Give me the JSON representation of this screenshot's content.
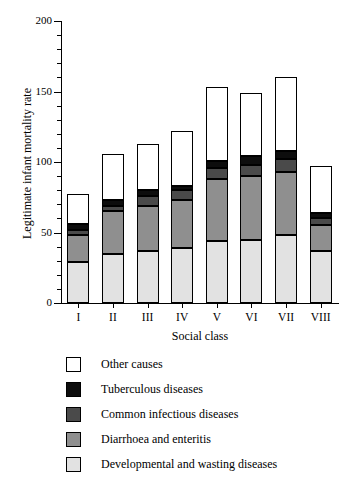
{
  "chart_data": {
    "type": "bar",
    "stacked": true,
    "title": "",
    "xlabel": "Social class",
    "ylabel": "Legitimate infant mortality rate",
    "categories": [
      "I",
      "II",
      "III",
      "IV",
      "V",
      "VI",
      "VII",
      "VIII"
    ],
    "ylim": [
      0,
      200
    ],
    "yticks": [
      0,
      50,
      100,
      150,
      200
    ],
    "ytick_labels": [
      "0",
      "50",
      "100",
      "150",
      "200"
    ],
    "yminor_step": 10,
    "grid": false,
    "legend_position": "below-plot",
    "series": [
      {
        "name": "Developmental and wasting diseases",
        "color": "#e2e2e2",
        "values": [
          29,
          35,
          37,
          39,
          44,
          45,
          48,
          37
        ]
      },
      {
        "name": "Diarrhoea and enteritis",
        "color": "#8f8f8f",
        "values": [
          19,
          30,
          32,
          34,
          44,
          45,
          45,
          18
        ]
      },
      {
        "name": "Common infectious diseases",
        "color": "#4a4a4a",
        "values": [
          4,
          4,
          7,
          7,
          8,
          8,
          9,
          5
        ]
      },
      {
        "name": "Tuberculous diseases",
        "color": "#0d0d0d",
        "values": [
          4,
          4,
          4,
          3,
          5,
          6,
          6,
          4
        ]
      },
      {
        "name": "Other causes",
        "color": "#ffffff",
        "values": [
          21,
          33,
          33,
          39,
          52,
          45,
          52,
          33
        ]
      }
    ],
    "totals": [
      77,
      106,
      113,
      122,
      153,
      149,
      160,
      97
    ],
    "legend_entries": [
      {
        "label": "Other causes",
        "color": "#ffffff"
      },
      {
        "label": "Tuberculous diseases",
        "color": "#0d0d0d"
      },
      {
        "label": "Common infectious diseases",
        "color": "#4a4a4a"
      },
      {
        "label": "Diarrhoea and enteritis",
        "color": "#8f8f8f"
      },
      {
        "label": "Developmental and wasting diseases",
        "color": "#e2e2e2"
      }
    ]
  }
}
